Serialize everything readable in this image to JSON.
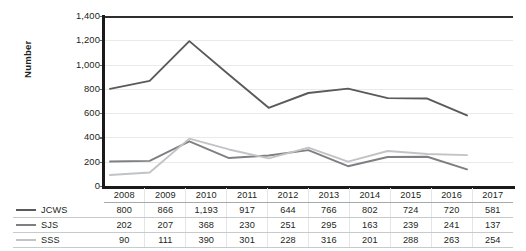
{
  "chart_data": {
    "type": "line",
    "title": "",
    "xlabel": "",
    "ylabel": "Number",
    "categories": [
      "2008",
      "2009",
      "2010",
      "2011",
      "2012",
      "2013",
      "2014",
      "2015",
      "2016",
      "2017"
    ],
    "ylim": [
      0,
      1400
    ],
    "yticks": [
      0,
      200,
      400,
      600,
      800,
      1000,
      1200,
      1400
    ],
    "ytick_labels": [
      "0",
      "200",
      "400",
      "600",
      "800",
      "1,000",
      "1,200",
      "1,400"
    ],
    "grid": true,
    "legend_position": "table-left",
    "series": [
      {
        "name": "JCWS",
        "color": "#595a5c",
        "values": [
          800,
          866,
          1193,
          917,
          644,
          766,
          802,
          724,
          720,
          581
        ],
        "value_labels": [
          "800",
          "866",
          "1,193",
          "917",
          "644",
          "766",
          "802",
          "724",
          "720",
          "581"
        ]
      },
      {
        "name": "SJS",
        "color": "#7e7f82",
        "values": [
          202,
          207,
          368,
          230,
          251,
          295,
          163,
          239,
          241,
          137
        ],
        "value_labels": [
          "202",
          "207",
          "368",
          "230",
          "251",
          "295",
          "163",
          "239",
          "241",
          "137"
        ]
      },
      {
        "name": "SSS",
        "color": "#c2c3c5",
        "values": [
          90,
          111,
          390,
          301,
          228,
          316,
          201,
          288,
          263,
          254
        ],
        "value_labels": [
          "90",
          "111",
          "390",
          "301",
          "228",
          "316",
          "201",
          "288",
          "263",
          "254"
        ]
      }
    ]
  }
}
